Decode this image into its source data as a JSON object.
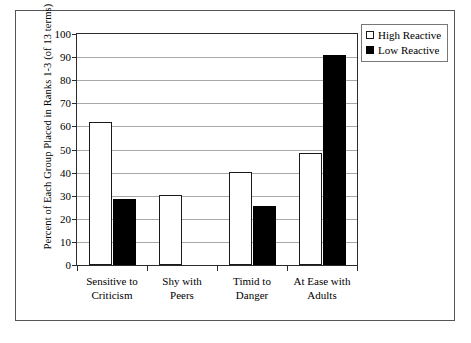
{
  "chart_data": {
    "type": "bar",
    "title": "",
    "xlabel": "",
    "ylabel": "Percent of Each Group Placed in Ranks 1-3 (of 13 terms)",
    "ylim": [
      0,
      100
    ],
    "ytick_step": 10,
    "yticks": [
      100,
      90,
      80,
      70,
      60,
      50,
      40,
      30,
      20,
      10,
      0
    ],
    "ytick_labels": [
      "100",
      "90",
      "80",
      "70",
      "60",
      "50",
      "40",
      "30",
      "20",
      "10",
      "0"
    ],
    "grid": true,
    "grid_axis": "y",
    "legend_position": "top-right",
    "categories": [
      "Sensitive to\nCriticism",
      "Shy with\nPeers",
      "Timid to\nDanger",
      "At Ease with\nAdults"
    ],
    "series": [
      {
        "name": "High Reactive",
        "color": "#ffffff",
        "edge_color": "#1a1a1a",
        "values": [
          62,
          30.5,
          40.3,
          48.5
        ]
      },
      {
        "name": "Low Reactive",
        "color": "#000000",
        "edge_color": "#000000",
        "values": [
          28.5,
          0,
          25.5,
          91
        ]
      }
    ]
  },
  "legend": {
    "items": [
      {
        "label": "High Reactive",
        "swatch": "hollow-square-swatch"
      },
      {
        "label": "Low Reactive",
        "swatch": "filled-square-swatch"
      }
    ]
  },
  "colors": {
    "frame": "#555555",
    "axis": "#2b2b2b",
    "gridline": "#a8a8a8",
    "high_reactive": "#ffffff",
    "low_reactive": "#000000",
    "background": "#ffffff"
  }
}
